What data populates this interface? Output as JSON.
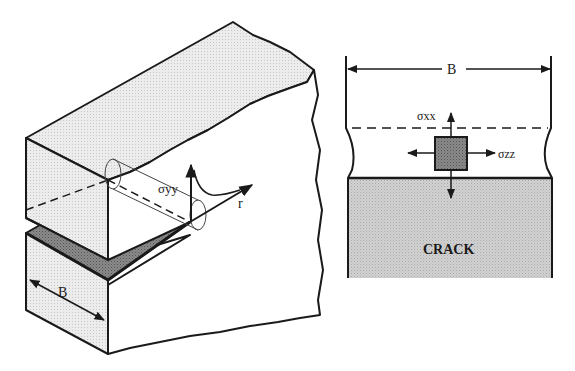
{
  "left_figure": {
    "title": "3D cracked specimen",
    "labels": {
      "stress": "σyy",
      "radial": "r",
      "thickness": "B"
    }
  },
  "right_figure": {
    "title": "Crack-tip cross-section",
    "labels": {
      "thickness": "B",
      "stress_x": "σxx",
      "stress_z": "σzz",
      "crack": "CRACK"
    }
  },
  "colors": {
    "line": "#1a1a1a",
    "face_light": "#e4e4e4",
    "crack_dark": "#8c8c8c",
    "crack_region": "#c4c4c4",
    "element": "#9a9a9a"
  }
}
